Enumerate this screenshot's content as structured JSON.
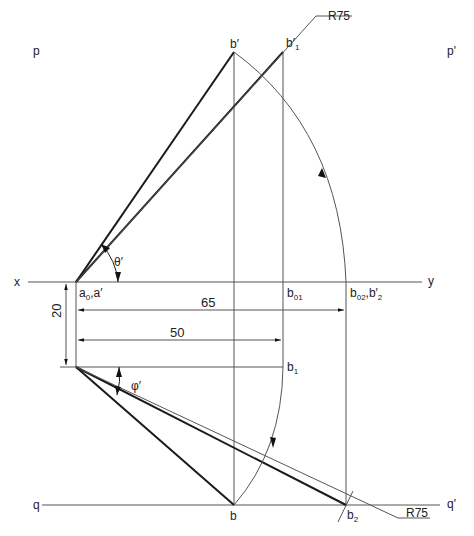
{
  "diagram": {
    "reference_lines": {
      "xy": {
        "left": "x",
        "right": "y"
      },
      "pq_left": "p",
      "pq_right": "p'",
      "q_left": "q",
      "q_right": "q'"
    },
    "points": {
      "b_prime": "b′",
      "b1_prime": "b′",
      "b1_prime_sub": "1",
      "a0_a_prime": "a",
      "a0_sub": "0",
      "a_prime_suffix": ",a′",
      "b01": "b",
      "b01_sub": "01",
      "b02": "b",
      "b02_sub": "02",
      "b2_prime_suffix": ",b′",
      "b2_prime_sub": "2",
      "b1": "b",
      "b1_sub": "1",
      "b": "b",
      "b2": "b",
      "b2_sub": "2"
    },
    "angles": {
      "theta": "θ′",
      "phi": "φ′"
    },
    "dimensions": {
      "d65": "65",
      "d50": "50",
      "d20": "20"
    },
    "radius_callouts": {
      "top": "R75",
      "bottom": "R75"
    },
    "colors": {
      "thick_line": "#1a1a1a",
      "thin_line": "#555555",
      "text": "#222222"
    }
  }
}
